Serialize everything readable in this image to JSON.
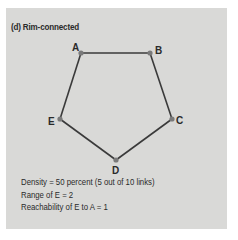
{
  "title": "(d)  Rim-connected",
  "colors": {
    "panel_bg": "#d9d9d7",
    "edge": "#3a3a3a",
    "node": "#7a7a7a",
    "text": "#2a2a2a"
  },
  "graph": {
    "nodes": [
      {
        "id": "A",
        "label": "A",
        "x": 81,
        "y": 53
      },
      {
        "id": "B",
        "label": "B",
        "x": 150,
        "y": 53
      },
      {
        "id": "C",
        "label": "C",
        "x": 172,
        "y": 119
      },
      {
        "id": "D",
        "label": "D",
        "x": 116,
        "y": 160
      },
      {
        "id": "E",
        "label": "E",
        "x": 60,
        "y": 119
      }
    ],
    "edges": [
      [
        "A",
        "B"
      ],
      [
        "B",
        "C"
      ],
      [
        "C",
        "D"
      ],
      [
        "D",
        "E"
      ],
      [
        "E",
        "A"
      ]
    ]
  },
  "stats": {
    "density": "Density = 50 percent (5 out of 10 links)",
    "range": "Range of E = 2",
    "reachability": "Reachability of E to A = 1"
  }
}
